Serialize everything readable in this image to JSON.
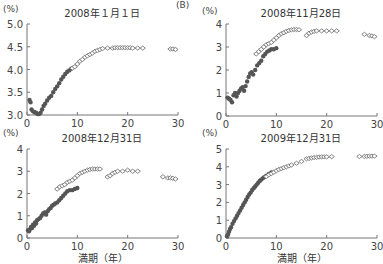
{
  "panel_label": "(B)",
  "xlabel": "満期（年）",
  "unit": "(%)",
  "colors": {
    "filled": "#555555",
    "open": "#666666",
    "axis": "#777777"
  },
  "chart_data": [
    {
      "type": "scatter",
      "title": "2008年１月１日",
      "xlabel": "",
      "ylabel": "(%)",
      "xlim": [
        0,
        30
      ],
      "ylim": [
        3.0,
        5.0
      ],
      "xticks": [
        0,
        10,
        20,
        30
      ],
      "yticks": [
        "3.0",
        "3.5",
        "4.0",
        "4.5",
        "5.0"
      ],
      "series": [
        {
          "name": "filled",
          "marker": "circle-filled",
          "x": [
            0.5,
            0.7,
            0.9,
            1.2,
            1.5,
            1.8,
            2.1,
            2.4,
            2.7,
            3.0,
            3.3,
            3.6,
            4.0,
            4.4,
            4.8,
            5.2,
            5.6,
            6.0,
            6.4,
            6.8,
            7.2,
            7.6,
            8.0,
            8.4,
            8.8
          ],
          "y": [
            3.33,
            3.28,
            3.12,
            3.08,
            3.06,
            3.05,
            3.02,
            3.02,
            3.05,
            3.12,
            3.2,
            3.25,
            3.32,
            3.38,
            3.42,
            3.5,
            3.57,
            3.63,
            3.7,
            3.78,
            3.84,
            3.9,
            3.95,
            3.98,
            4.02
          ]
        },
        {
          "name": "open",
          "marker": "diamond-open",
          "x": [
            9.0,
            9.5,
            10.0,
            10.5,
            11.0,
            11.5,
            12.0,
            12.5,
            13.0,
            13.5,
            14.0,
            14.5,
            15.0,
            16.0,
            17.0,
            17.5,
            18.0,
            18.5,
            19.0,
            19.5,
            20.0,
            20.5,
            21.0,
            22.0,
            23.0,
            28.5,
            29.0,
            29.5
          ],
          "y": [
            4.03,
            4.06,
            4.12,
            4.18,
            4.22,
            4.27,
            4.3,
            4.33,
            4.36,
            4.4,
            4.42,
            4.44,
            4.46,
            4.47,
            4.47,
            4.48,
            4.48,
            4.48,
            4.48,
            4.48,
            4.48,
            4.48,
            4.47,
            4.47,
            4.47,
            4.45,
            4.45,
            4.44
          ]
        }
      ]
    },
    {
      "type": "scatter",
      "title": "2008年11月28日",
      "xlabel": "",
      "ylabel": "(%)",
      "xlim": [
        0,
        30
      ],
      "ylim": [
        0,
        4
      ],
      "xticks": [
        0,
        10,
        20,
        30
      ],
      "yticks": [
        "0",
        "1",
        "2",
        "3",
        "4"
      ],
      "series": [
        {
          "name": "filled",
          "marker": "circle-filled",
          "x": [
            0.3,
            0.6,
            0.9,
            1.2,
            1.5,
            1.8,
            2.1,
            2.4,
            2.7,
            3.0,
            3.3,
            3.6,
            3.9,
            4.2,
            4.5,
            4.8,
            5.1,
            5.4,
            5.8,
            6.2,
            6.6,
            7.0,
            7.4,
            7.8,
            8.2,
            8.6,
            9.0,
            9.5,
            10.0
          ],
          "y": [
            0.8,
            0.75,
            0.7,
            0.6,
            0.9,
            1.0,
            0.85,
            1.0,
            1.1,
            1.2,
            1.25,
            1.1,
            1.3,
            1.5,
            1.7,
            1.85,
            1.9,
            1.8,
            2.0,
            2.2,
            2.3,
            2.4,
            2.6,
            2.7,
            2.8,
            2.85,
            2.9,
            2.9,
            2.95
          ]
        },
        {
          "name": "open",
          "marker": "diamond-open",
          "x": [
            6.0,
            6.5,
            7.0,
            7.5,
            8.0,
            8.5,
            9.0,
            9.5,
            10.0,
            10.5,
            11.0,
            11.5,
            12.0,
            12.5,
            13.0,
            13.5,
            14.0,
            14.5,
            16.0,
            16.5,
            17.0,
            17.5,
            18.0,
            19.0,
            20.0,
            21.0,
            22.0,
            27.5,
            28.5,
            29.0,
            29.5
          ],
          "y": [
            2.7,
            2.8,
            2.9,
            3.0,
            3.1,
            3.15,
            3.2,
            3.3,
            3.4,
            3.5,
            3.58,
            3.62,
            3.68,
            3.72,
            3.75,
            3.76,
            3.76,
            3.75,
            3.5,
            3.6,
            3.65,
            3.68,
            3.7,
            3.7,
            3.7,
            3.7,
            3.7,
            3.55,
            3.5,
            3.48,
            3.45
          ]
        }
      ]
    },
    {
      "type": "scatter",
      "title": "2008年12月31日",
      "xlabel": "満期（年）",
      "ylabel": "(%)",
      "xlim": [
        0,
        30
      ],
      "ylim": [
        0,
        4
      ],
      "xticks": [
        0,
        10,
        20,
        30
      ],
      "yticks": [
        "0",
        "1",
        "2",
        "3",
        "4"
      ],
      "series": [
        {
          "name": "filled",
          "marker": "circle-filled",
          "x": [
            0.2,
            0.4,
            0.6,
            0.8,
            1.0,
            1.2,
            1.4,
            1.6,
            1.8,
            2.0,
            2.3,
            2.6,
            2.9,
            3.2,
            3.5,
            3.8,
            4.1,
            4.4,
            4.7,
            5.0,
            5.3,
            5.6,
            6.0,
            6.4,
            6.8,
            7.2,
            7.6,
            8.0,
            8.5,
            9.0,
            9.5,
            10.0
          ],
          "y": [
            0.35,
            0.3,
            0.4,
            0.5,
            0.45,
            0.6,
            0.55,
            0.7,
            0.65,
            0.8,
            0.85,
            0.9,
            1.0,
            1.1,
            1.15,
            1.05,
            1.2,
            1.3,
            1.35,
            1.45,
            1.5,
            1.55,
            1.6,
            1.7,
            1.8,
            1.9,
            2.0,
            2.1,
            2.15,
            2.15,
            2.2,
            2.25
          ]
        },
        {
          "name": "open",
          "marker": "diamond-open",
          "x": [
            6.0,
            6.5,
            7.0,
            7.5,
            8.0,
            8.5,
            9.0,
            9.5,
            10.0,
            10.5,
            11.0,
            11.5,
            12.0,
            12.5,
            13.0,
            13.5,
            14.0,
            14.5,
            16.0,
            16.5,
            17.0,
            17.5,
            18.0,
            19.0,
            20.0,
            21.0,
            22.0,
            27.0,
            28.0,
            28.5,
            29.0,
            29.5
          ],
          "y": [
            2.2,
            2.3,
            2.35,
            2.4,
            2.5,
            2.55,
            2.6,
            2.7,
            2.8,
            2.9,
            2.95,
            3.0,
            3.05,
            3.08,
            3.1,
            3.1,
            3.1,
            3.1,
            2.75,
            2.8,
            2.9,
            2.95,
            3.0,
            3.0,
            3.05,
            3.0,
            3.0,
            2.75,
            2.7,
            2.7,
            2.68,
            2.65
          ]
        }
      ]
    },
    {
      "type": "scatter",
      "title": "2009年12月31日",
      "xlabel": "満期（年）",
      "ylabel": "(%)",
      "xlim": [
        0,
        30
      ],
      "ylim": [
        0,
        5
      ],
      "xticks": [
        0,
        10,
        20,
        30
      ],
      "yticks": [
        "0",
        "1",
        "2",
        "3",
        "4",
        "5"
      ],
      "series": [
        {
          "name": "filled",
          "marker": "circle-filled",
          "x": [
            0.2,
            0.4,
            0.6,
            0.8,
            1.0,
            1.3,
            1.6,
            1.9,
            2.2,
            2.5,
            2.8,
            3.1,
            3.4,
            3.7,
            4.0,
            4.3,
            4.6,
            4.9,
            5.2,
            5.5,
            5.8,
            6.1,
            6.4,
            6.7,
            7.0,
            7.3,
            7.6,
            8.0,
            8.5,
            9.0
          ],
          "y": [
            0.1,
            0.2,
            0.35,
            0.5,
            0.6,
            0.8,
            0.95,
            1.1,
            1.25,
            1.4,
            1.55,
            1.7,
            1.85,
            2.0,
            2.15,
            2.3,
            2.45,
            2.55,
            2.7,
            2.8,
            2.9,
            3.0,
            3.1,
            3.2,
            3.28,
            3.35,
            3.42,
            3.5,
            3.6,
            3.68
          ]
        },
        {
          "name": "open",
          "marker": "diamond-open",
          "x": [
            8.0,
            8.5,
            9.0,
            9.5,
            10.0,
            10.5,
            11.0,
            11.5,
            12.0,
            12.5,
            13.0,
            14.0,
            15.0,
            16.0,
            16.5,
            17.0,
            17.5,
            18.0,
            18.5,
            19.0,
            19.5,
            20.0,
            21.0,
            26.5,
            27.5,
            28.0,
            28.5,
            29.0,
            29.5
          ],
          "y": [
            3.45,
            3.55,
            3.62,
            3.7,
            3.78,
            3.85,
            3.9,
            3.95,
            4.0,
            4.05,
            4.1,
            4.2,
            4.3,
            4.45,
            4.47,
            4.5,
            4.52,
            4.53,
            4.55,
            4.56,
            4.56,
            4.56,
            4.57,
            4.58,
            4.58,
            4.59,
            4.6,
            4.6,
            4.6
          ]
        }
      ]
    }
  ]
}
